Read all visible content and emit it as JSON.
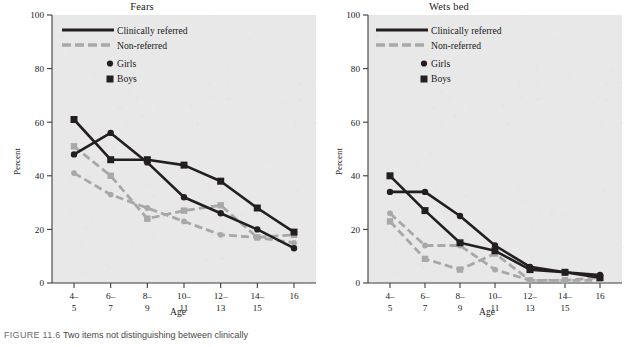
{
  "figure": {
    "caption_label": "FIGURE 11.6",
    "caption_text": "Two items not distinguishing between clinically",
    "background_color": "#e8e8e8",
    "series_colors": {
      "clinically_referred": "#231f20",
      "non_referred": "#a8a8a8"
    }
  },
  "legend": {
    "clinically_referred": "Clinically referred",
    "non_referred": "Non-referred",
    "girls": "Girls",
    "boys": "Boys"
  },
  "axes": {
    "ylabel": "Percent",
    "xlabel": "Age",
    "yticks": [
      "0",
      "20",
      "40",
      "60",
      "80",
      "100"
    ],
    "xtick_top": [
      "4–",
      "6–",
      "8–",
      "10–",
      "12–",
      "14–",
      "16"
    ],
    "xtick_bottom": [
      "5",
      "7",
      "9",
      "11",
      "13",
      "15",
      ""
    ]
  },
  "chart_data": [
    {
      "type": "line",
      "title": "Fears",
      "xlabel": "Age",
      "ylabel": "Percent",
      "ylim": [
        0,
        100
      ],
      "yticks": [
        0,
        20,
        40,
        60,
        80,
        100
      ],
      "grid": false,
      "legend_position": "top-center-inside",
      "categories": [
        "4-5",
        "6-7",
        "8-9",
        "10-11",
        "12-13",
        "14-15",
        "16"
      ],
      "series": [
        {
          "name": "Clinically referred – Boys",
          "group": "Clinically referred",
          "sex": "Boys",
          "marker": "square",
          "line": "solid",
          "color": "#231f20",
          "values": [
            61,
            46,
            46,
            44,
            38,
            28,
            19
          ]
        },
        {
          "name": "Clinically referred – Girls",
          "group": "Clinically referred",
          "sex": "Girls",
          "marker": "circle",
          "line": "solid",
          "color": "#231f20",
          "values": [
            48,
            56,
            45,
            32,
            26,
            20,
            13
          ]
        },
        {
          "name": "Non-referred – Boys",
          "group": "Non-referred",
          "sex": "Boys",
          "marker": "square",
          "line": "dashed",
          "color": "#a8a8a8",
          "values": [
            51,
            40,
            24,
            27,
            29,
            17,
            18
          ]
        },
        {
          "name": "Non-referred – Girls",
          "group": "Non-referred",
          "sex": "Girls",
          "marker": "circle",
          "line": "dashed",
          "color": "#a8a8a8",
          "values": [
            41,
            33,
            28,
            23,
            18,
            17,
            15
          ]
        }
      ]
    },
    {
      "type": "line",
      "title": "Wets bed",
      "xlabel": "Age",
      "ylabel": "Percent",
      "ylim": [
        0,
        100
      ],
      "yticks": [
        0,
        20,
        40,
        60,
        80,
        100
      ],
      "grid": false,
      "legend_position": "top-center-inside",
      "categories": [
        "4-5",
        "6-7",
        "8-9",
        "10-11",
        "12-13",
        "14-15",
        "16"
      ],
      "series": [
        {
          "name": "Clinically referred – Boys",
          "group": "Clinically referred",
          "sex": "Boys",
          "marker": "square",
          "line": "solid",
          "color": "#231f20",
          "values": [
            40,
            27,
            15,
            12,
            5,
            4,
            2
          ]
        },
        {
          "name": "Clinically referred – Girls",
          "group": "Clinically referred",
          "sex": "Girls",
          "marker": "circle",
          "line": "solid",
          "color": "#231f20",
          "values": [
            34,
            34,
            25,
            14,
            6,
            4,
            3
          ]
        },
        {
          "name": "Non-referred – Boys",
          "group": "Non-referred",
          "sex": "Boys",
          "marker": "square",
          "line": "dashed",
          "color": "#a8a8a8",
          "values": [
            23,
            9,
            5,
            11,
            1,
            1,
            2
          ]
        },
        {
          "name": "Non-referred – Girls",
          "group": "Non-referred",
          "sex": "Girls",
          "marker": "circle",
          "line": "dashed",
          "color": "#a8a8a8",
          "values": [
            26,
            14,
            14,
            5,
            1,
            1,
            1
          ]
        }
      ]
    }
  ]
}
